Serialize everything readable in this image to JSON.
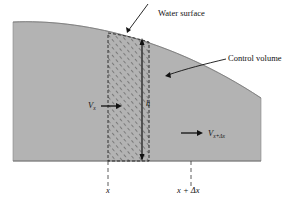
{
  "labels": {
    "water_surface": "Water surface",
    "control_volume": "Control volume",
    "depth": "h",
    "v_in_main": "V",
    "v_in_sub": "x",
    "v_out_main": "V",
    "v_out_sub": "x+Δx",
    "x_left": "x",
    "x_right": "x + Δx"
  },
  "colors": {
    "water_fill": "#b3b3b3",
    "hatch": "#555555",
    "line": "#111111",
    "background": "#ffffff"
  }
}
